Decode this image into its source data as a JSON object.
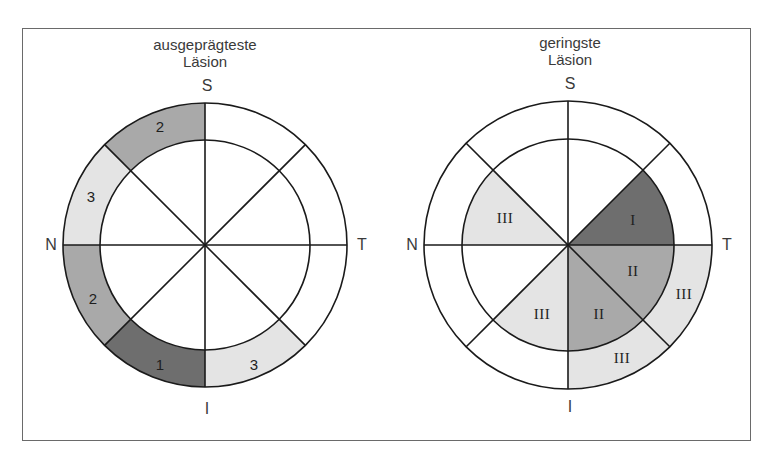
{
  "colors": {
    "grade_1": "#6e6e6e",
    "grade_2": "#a9a9a9",
    "grade_3": "#e4e4e4",
    "background": "#ffffff",
    "stroke": "#1a1a1a",
    "text": "#3a3a3a"
  },
  "directions": {
    "superior": "S",
    "temporal": "T",
    "inferior": "I",
    "nasal": "N"
  },
  "left_diagram": {
    "title_line1": "ausgeprägteste",
    "title_line2": "Läsion",
    "ring_segments": [
      {
        "sector": "superior-nasal-upper",
        "label": "2",
        "grade": 2
      },
      {
        "sector": "nasal-upper",
        "label": "3",
        "grade": 3
      },
      {
        "sector": "nasal-lower",
        "label": "2",
        "grade": 2
      },
      {
        "sector": "inferior-nasal",
        "label": "1",
        "grade": 1
      },
      {
        "sector": "inferior-temporal",
        "label": "3",
        "grade": 3
      }
    ]
  },
  "right_diagram": {
    "title_line1": "geringste",
    "title_line2": "Läsion",
    "inner_segments": [
      {
        "sector": "superior-temporal-lower",
        "label": "I",
        "grade": 1
      },
      {
        "sector": "temporal-lower",
        "label": "II",
        "grade": 2
      },
      {
        "sector": "inferior-temporal",
        "label": "II",
        "grade": 2
      },
      {
        "sector": "inferior-nasal",
        "label": "III",
        "grade": 3
      },
      {
        "sector": "nasal-upper",
        "label": "III",
        "grade": 3
      }
    ],
    "ring_segments": [
      {
        "sector": "temporal-lower",
        "label": "III",
        "grade": 3
      },
      {
        "sector": "inferior-temporal",
        "label": "III",
        "grade": 3
      }
    ]
  }
}
